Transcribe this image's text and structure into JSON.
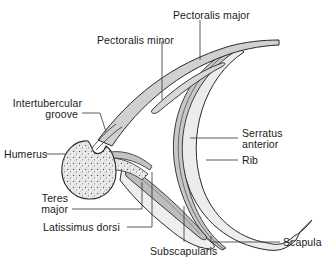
{
  "diagram": {
    "colors": {
      "outline": "#2a2a2a",
      "muscle_fill": "#cfcfcf",
      "muscle_fill_dark": "#b5b5b5",
      "bone_fill": "#e8e8e8",
      "leader_line": "#333333",
      "background": "#ffffff"
    },
    "labels": {
      "pectoralis_major": "Pectoralis major",
      "pectoralis_minor": "Pectoralis minor",
      "intertubercular_groove_line1": "Intertubercular",
      "intertubercular_groove_line2": "groove",
      "humerus": "Humerus",
      "serratus_anterior_line1": "Serratus",
      "serratus_anterior_line2": "anterior",
      "rib": "Rib",
      "teres_major_line1": "Teres",
      "teres_major_line2": "major",
      "latissimus_dorsi": "Latissimus dorsi",
      "subscapularis": "Subscapularis",
      "scapula": "Scapula"
    },
    "structures": [
      "pectoralis-major",
      "pectoralis-minor",
      "humerus",
      "intertubercular-groove",
      "serratus-anterior",
      "rib",
      "teres-major",
      "latissimus-dorsi",
      "subscapularis",
      "scapula"
    ]
  }
}
